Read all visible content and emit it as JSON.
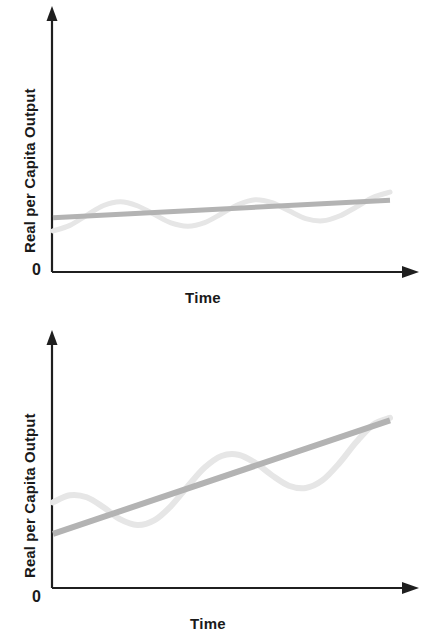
{
  "figure": {
    "background": "#ffffff",
    "panel_count": 2
  },
  "colors": {
    "axis": "#1f1f1f",
    "text": "#1a1a1a",
    "trend_line": "#b3b3b3",
    "cycle_line": "#e6e6e6"
  },
  "panels": [
    {
      "id": "top",
      "y_axis_label": "Real per Capita Output",
      "x_axis_label": "Time",
      "origin_label": "0"
    },
    {
      "id": "bottom",
      "y_axis_label": "Real per Capita Output",
      "x_axis_label": "Time",
      "origin_label": "0"
    }
  ],
  "chart_data": [
    {
      "type": "line",
      "title": "",
      "subtitle": "",
      "xlabel": "Time",
      "ylabel": "Real per Capita Output",
      "grid": false,
      "legend": "none",
      "annotations": [],
      "axis": {
        "x_tick_labels": [],
        "y_tick_labels": [
          "0"
        ],
        "xlim": [
          0,
          1
        ],
        "ylim": [
          0,
          1
        ],
        "arrowheads": true
      },
      "series": [
        {
          "name": "Long-run growth trend",
          "style": "straight-line",
          "color": "#b3b3b3",
          "linewidth": 5,
          "description": "Shallow upward-sloping straight trend line",
          "x": [
            0.0,
            1.0
          ],
          "values": [
            0.215,
            0.285
          ]
        },
        {
          "name": "Actual output (business cycle)",
          "style": "sine-wave",
          "color": "#e6e6e6",
          "linewidth": 5,
          "description": "Low-amplitude, high-frequency oscillation about the trend",
          "cycles": 4.1,
          "amplitude": 0.055,
          "x": [
            0.0,
            0.05,
            0.1,
            0.15,
            0.2,
            0.25,
            0.3,
            0.35,
            0.4,
            0.45,
            0.5,
            0.55,
            0.6,
            0.65,
            0.7,
            0.75,
            0.8,
            0.85,
            0.9,
            0.95,
            1.0
          ],
          "values": [
            0.163,
            0.185,
            0.225,
            0.264,
            0.279,
            0.263,
            0.229,
            0.195,
            0.182,
            0.196,
            0.231,
            0.268,
            0.287,
            0.275,
            0.243,
            0.212,
            0.203,
            0.222,
            0.258,
            0.296,
            0.317
          ]
        }
      ]
    },
    {
      "type": "line",
      "title": "",
      "subtitle": "",
      "xlabel": "Time",
      "ylabel": "Real per Capita Output",
      "grid": false,
      "legend": "none",
      "annotations": [],
      "axis": {
        "x_tick_labels": [],
        "y_tick_labels": [
          "0"
        ],
        "xlim": [
          0,
          1
        ],
        "ylim": [
          0,
          1
        ],
        "arrowheads": true
      },
      "series": [
        {
          "name": "Long-run growth trend",
          "style": "straight-line",
          "color": "#b3b3b3",
          "linewidth": 6,
          "description": "Steep upward-sloping straight trend line",
          "x": [
            0.0,
            1.0
          ],
          "values": [
            0.215,
            0.665
          ]
        },
        {
          "name": "Actual output (business cycle)",
          "style": "sine-wave",
          "color": "#e6e6e6",
          "linewidth": 6,
          "description": "High-amplitude, low-frequency oscillation about the steeper trend",
          "cycles": 2.75,
          "amplitude": 0.125,
          "x": [
            0.0,
            0.05,
            0.1,
            0.15,
            0.2,
            0.25,
            0.3,
            0.35,
            0.4,
            0.45,
            0.5,
            0.55,
            0.6,
            0.65,
            0.7,
            0.75,
            0.8,
            0.85,
            0.9,
            0.95,
            1.0
          ],
          "values": [
            0.34,
            0.368,
            0.36,
            0.32,
            0.272,
            0.25,
            0.268,
            0.325,
            0.404,
            0.478,
            0.524,
            0.529,
            0.497,
            0.447,
            0.406,
            0.397,
            0.428,
            0.496,
            0.579,
            0.648,
            0.675
          ]
        }
      ]
    }
  ]
}
